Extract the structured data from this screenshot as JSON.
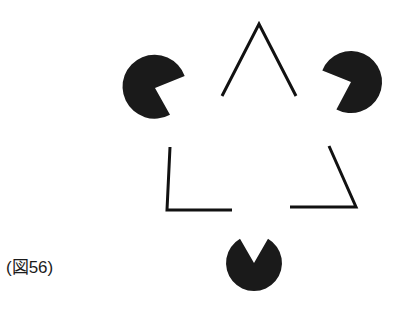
{
  "figure": {
    "caption": "(図56)",
    "colors": {
      "background": "#ffffff",
      "ink": "#111111",
      "disc": "#1a1a1a",
      "caption_text": "#1b1b1b"
    },
    "illusory_triangle": {
      "description": "Illusory (subjective) triangle outline drawn as three separate corner angle strokes, apex up",
      "stroke_width": 3,
      "vertices": [
        {
          "x": 259,
          "y": 24
        },
        {
          "x": 167,
          "y": 210
        },
        {
          "x": 356,
          "y": 207
        }
      ],
      "corner_strokes": [
        {
          "name": "apex-corner",
          "points": "222 96, 259 24, 296 96"
        },
        {
          "name": "bottom-left-corner",
          "points": "170 147, 167 210, 232 210"
        },
        {
          "name": "bottom-right-corner",
          "points": "290 207, 356 207, 329 146"
        }
      ]
    },
    "pacman_discs": [
      {
        "name": "disc-top-left",
        "cx": 155,
        "cy": 88,
        "r": 32,
        "notch_start_deg": -22,
        "notch_end_deg": 62
      },
      {
        "name": "disc-top-right",
        "cx": 351,
        "cy": 82,
        "r": 31,
        "notch_start_deg": 118,
        "notch_end_deg": 202
      },
      {
        "name": "disc-bottom",
        "cx": 254,
        "cy": 263,
        "r": 28,
        "notch_start_deg": 240,
        "notch_end_deg": 300
      }
    ]
  }
}
